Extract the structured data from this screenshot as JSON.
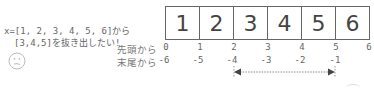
{
  "description": {
    "line1": "x=[1, 2, 3, 4, 5, 6]から",
    "line2": "[3,4,5]を抜き出したい!"
  },
  "face_icon": "confused-face-icon",
  "row_labels": {
    "from_start": "先頭から",
    "from_end": "末尾から"
  },
  "array": {
    "cells": [
      "1",
      "2",
      "3",
      "4",
      "5",
      "6"
    ]
  },
  "positive_indices": [
    "0",
    "1",
    "2",
    "3",
    "4",
    "5",
    "6"
  ],
  "negative_indices": [
    "-6",
    "-5",
    "-4",
    "-3",
    "-2",
    "-1"
  ],
  "slice_arrow": {
    "from_index": "-4",
    "to_index": "-1",
    "style": "dotted double-headed arrow"
  }
}
